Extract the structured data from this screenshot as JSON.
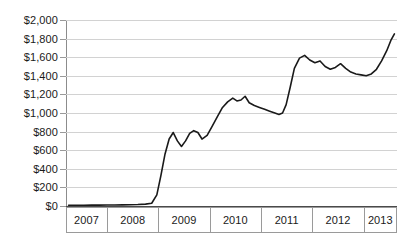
{
  "chart_data": {
    "type": "line",
    "title": "",
    "subtitle": "",
    "xlabel": "",
    "ylabel": "",
    "legend": [],
    "legend_position": "none",
    "grid": true,
    "grid_axis": "y",
    "xlim": [
      2006.75,
      2013.2
    ],
    "ylim": [
      0,
      2000
    ],
    "y_ticks": [
      0,
      200,
      400,
      600,
      800,
      1000,
      1200,
      1400,
      1600,
      1800,
      2000
    ],
    "y_tick_labels": [
      "$0",
      "$200",
      "$400",
      "$600",
      "$800",
      "$1,000",
      "$1,200",
      "$1,400",
      "$1,600",
      "$1,800",
      "$2,000"
    ],
    "x_ticks": [
      2007,
      2008,
      2009,
      2010,
      2011,
      2012,
      2013
    ],
    "x_tick_labels": [
      "2007",
      "2008",
      "2009",
      "2010",
      "2011",
      "2012",
      "2013"
    ],
    "series": [
      {
        "name": "value",
        "color": "#1a1a1a",
        "x": [
          2006.8,
          2006.95,
          2007.1,
          2007.25,
          2007.4,
          2007.55,
          2007.7,
          2007.85,
          2008.0,
          2008.15,
          2008.3,
          2008.42,
          2008.52,
          2008.6,
          2008.68,
          2008.76,
          2008.84,
          2008.92,
          2009.0,
          2009.08,
          2009.16,
          2009.24,
          2009.32,
          2009.4,
          2009.5,
          2009.6,
          2009.7,
          2009.8,
          2009.9,
          2010.0,
          2010.08,
          2010.16,
          2010.24,
          2010.32,
          2010.42,
          2010.52,
          2010.62,
          2010.72,
          2010.82,
          2010.9,
          2010.97,
          2011.04,
          2011.12,
          2011.2,
          2011.3,
          2011.4,
          2011.5,
          2011.6,
          2011.7,
          2011.8,
          2011.9,
          2012.0,
          2012.1,
          2012.2,
          2012.3,
          2012.4,
          2012.5,
          2012.6,
          2012.7,
          2012.8,
          2012.9,
          2013.0,
          2013.08,
          2013.15
        ],
        "y": [
          8,
          8,
          8,
          9,
          9,
          10,
          10,
          12,
          14,
          16,
          20,
          30,
          120,
          330,
          560,
          720,
          790,
          700,
          640,
          700,
          780,
          810,
          790,
          720,
          760,
          860,
          960,
          1060,
          1120,
          1160,
          1130,
          1140,
          1180,
          1110,
          1080,
          1060,
          1040,
          1020,
          1000,
          985,
          1000,
          1090,
          1280,
          1480,
          1590,
          1620,
          1570,
          1540,
          1560,
          1500,
          1470,
          1490,
          1530,
          1480,
          1440,
          1420,
          1410,
          1400,
          1420,
          1470,
          1560,
          1670,
          1780,
          1850
        ]
      }
    ]
  },
  "axes": {
    "currency_symbol": "$"
  }
}
